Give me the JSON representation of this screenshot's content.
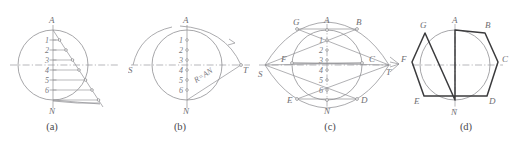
{
  "figure": {
    "width": 516,
    "height": 143,
    "background": "#ffffff",
    "line_color": "#8f8f93",
    "polygon_color": "#3b3b3d",
    "label_color": "#6e6e72"
  },
  "panels": [
    {
      "id": "a",
      "caption": "(a)",
      "caption_x": 52,
      "caption_y": 127,
      "origin_x": 0,
      "width": 128,
      "description": "Vertical diameter AN divided into seven equal parts with parallel transfer lines",
      "circle": {
        "cx": 53,
        "cy": 65,
        "r": 35
      },
      "vertex_labels": [
        {
          "text": "A",
          "x": 49,
          "y": 23
        },
        {
          "text": "N",
          "x": 49,
          "y": 113
        }
      ],
      "division_labels": [
        "1",
        "2",
        "3",
        "4",
        "5",
        "6"
      ],
      "division_count": 7,
      "axis_top": {
        "x": 53,
        "y": 28
      },
      "axis_bottom": {
        "x": 53,
        "y": 102
      },
      "has_horizontal_centerline": true,
      "has_hatch_lines": true
    },
    {
      "id": "b",
      "caption": "(b)",
      "caption_x": 180,
      "caption_y": 127,
      "origin_x": 128,
      "width": 128,
      "description": "Arcs of radius R = AN swung from A and N to locate points S and T on the horizontal centerline",
      "circle": {
        "cx": 187,
        "cy": 65,
        "r": 35
      },
      "vertex_labels": [
        {
          "text": "A",
          "x": 183,
          "y": 23
        },
        {
          "text": "N",
          "x": 183,
          "y": 113
        },
        {
          "text": "S",
          "x": 129,
          "y": 72
        },
        {
          "text": "T",
          "x": 243,
          "y": 72
        }
      ],
      "division_labels": [
        "1",
        "2",
        "3",
        "4",
        "5",
        "6"
      ],
      "division_count": 7,
      "radius_note": "R=AN",
      "point_s": {
        "x": 133,
        "y": 65
      },
      "point_t": {
        "x": 241,
        "y": 65
      },
      "has_horizontal_centerline": true
    },
    {
      "id": "c",
      "caption": "(c)",
      "caption_x": 330,
      "caption_y": 127,
      "origin_x": 256,
      "width": 134,
      "description": "Rays from S and T through the even division points extended to cut the circle, giving vertices B C D E F G",
      "circle": {
        "cx": 327,
        "cy": 65,
        "r": 35
      },
      "vertex_labels": [
        {
          "text": "A",
          "x": 324,
          "y": 23
        },
        {
          "text": "B",
          "x": 356,
          "y": 25
        },
        {
          "text": "C",
          "x": 375,
          "y": 62
        },
        {
          "text": "D",
          "x": 361,
          "y": 100
        },
        {
          "text": "E",
          "x": 288,
          "y": 100
        },
        {
          "text": "F",
          "x": 276,
          "y": 62
        },
        {
          "text": "G",
          "x": 293,
          "y": 25
        },
        {
          "text": "N",
          "x": 324,
          "y": 113
        },
        {
          "text": "S",
          "x": 261,
          "y": 76
        },
        {
          "text": "T",
          "x": 387,
          "y": 73
        }
      ],
      "division_labels": [
        "1",
        "2",
        "3",
        "4",
        "5",
        "6"
      ],
      "division_count": 7,
      "point_s": {
        "x": 265,
        "y": 65
      },
      "point_t": {
        "x": 389,
        "y": 65
      },
      "has_horizontal_centerline": true
    },
    {
      "id": "d",
      "caption": "(d)",
      "caption_x": 466,
      "caption_y": 127,
      "origin_x": 390,
      "width": 126,
      "description": "The finished regular heptagon A B C D E F G N inscribed in the circle",
      "circle": {
        "cx": 455,
        "cy": 65,
        "r": 35
      },
      "vertex_labels": [
        {
          "text": "A",
          "x": 452,
          "y": 23
        },
        {
          "text": "B",
          "x": 485,
          "y": 27
        },
        {
          "text": "C",
          "x": 503,
          "y": 62
        },
        {
          "text": "D",
          "x": 489,
          "y": 101
        },
        {
          "text": "E",
          "x": 417,
          "y": 101
        },
        {
          "text": "F",
          "x": 404,
          "y": 62
        },
        {
          "text": "G",
          "x": 421,
          "y": 27
        },
        {
          "text": "N",
          "x": 452,
          "y": 116
        }
      ],
      "polygon_vertices": [
        "A",
        "B",
        "C",
        "D",
        "E",
        "F",
        "G",
        "N"
      ],
      "has_horizontal_centerline": true,
      "has_vertical_centerline": true
    }
  ]
}
